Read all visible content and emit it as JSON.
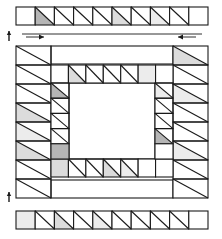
{
  "figure": {
    "background_color": "#ffffff",
    "line_color": "#1a1a1a",
    "cell_fill_plain": "#ffffff",
    "shade_dark": "#b5b5b5",
    "shade_light": "#dcdcdc",
    "shade_pale": "#ececec",
    "unit_size": 19.2,
    "stroke_width": 1.1
  },
  "strips": {
    "top_strip": {
      "label": "top-border-strip",
      "x": 16,
      "y": 7,
      "cells": 10,
      "cell_width": 19.2,
      "cell_height": 18,
      "units": [
        {
          "index": 0,
          "diagonal": "none",
          "fill": "#ffffff"
        },
        {
          "index": 1,
          "diagonal": "tl-br",
          "fill": "#b5b5b5"
        },
        {
          "index": 2,
          "diagonal": "tl-br",
          "fill": "#ffffff"
        },
        {
          "index": 3,
          "diagonal": "tl-br",
          "fill": "#ffffff"
        },
        {
          "index": 4,
          "diagonal": "tl-br",
          "fill": "#ffffff"
        },
        {
          "index": 5,
          "diagonal": "tl-br",
          "fill": "#dcdcdc"
        },
        {
          "index": 6,
          "diagonal": "tl-br",
          "fill": "#ffffff"
        },
        {
          "index": 7,
          "diagonal": "tl-br",
          "fill": "#ececec"
        },
        {
          "index": 8,
          "diagonal": "tl-br",
          "fill": "#ffffff"
        },
        {
          "index": 9,
          "diagonal": "none",
          "fill": "#ffffff"
        }
      ]
    },
    "bottom_strip": {
      "label": "bottom-border-strip",
      "x": 16,
      "y": 211,
      "cells": 10,
      "cell_width": 19.2,
      "cell_height": 18,
      "units": [
        {
          "index": 0,
          "diagonal": "none",
          "fill": "#ececec"
        },
        {
          "index": 1,
          "diagonal": "tl-br",
          "fill": "#ffffff"
        },
        {
          "index": 2,
          "diagonal": "tl-br",
          "fill": "#dcdcdc"
        },
        {
          "index": 3,
          "diagonal": "tl-br",
          "fill": "#ffffff"
        },
        {
          "index": 4,
          "diagonal": "tl-br",
          "fill": "#ececec"
        },
        {
          "index": 5,
          "diagonal": "tl-br",
          "fill": "#ffffff"
        },
        {
          "index": 6,
          "diagonal": "tl-br",
          "fill": "#ffffff"
        },
        {
          "index": 7,
          "diagonal": "tl-br",
          "fill": "#ffffff"
        },
        {
          "index": 8,
          "diagonal": "tl-br",
          "fill": "#ffffff"
        },
        {
          "index": 9,
          "diagonal": "none",
          "fill": "#ffffff"
        }
      ]
    }
  },
  "main_block": {
    "label": "main-quilt-block",
    "x": 16,
    "y": 46,
    "width": 192,
    "height": 152,
    "outer_ring": {
      "label": "outer-border-ring",
      "left_column": {
        "cells": 8,
        "units": [
          {
            "index": 0,
            "diagonal": "tl-br",
            "fill": "#ffffff"
          },
          {
            "index": 1,
            "diagonal": "tl-br",
            "fill": "#ffffff"
          },
          {
            "index": 2,
            "diagonal": "tl-br",
            "fill": "#ffffff"
          },
          {
            "index": 3,
            "diagonal": "tl-br",
            "fill": "#dcdcdc"
          },
          {
            "index": 4,
            "diagonal": "tl-br",
            "fill": "#ececec"
          },
          {
            "index": 5,
            "diagonal": "tl-br",
            "fill": "#dcdcdc"
          },
          {
            "index": 6,
            "diagonal": "tl-br",
            "fill": "#ffffff"
          },
          {
            "index": 7,
            "diagonal": "tl-br",
            "fill": "#ffffff"
          }
        ]
      },
      "right_column": {
        "cells": 8,
        "units": [
          {
            "index": 0,
            "diagonal": "tl-br",
            "fill": "#dcdcdc"
          },
          {
            "index": 1,
            "diagonal": "tl-br",
            "fill": "#ffffff"
          },
          {
            "index": 2,
            "diagonal": "tl-br",
            "fill": "#ececec"
          },
          {
            "index": 3,
            "diagonal": "tl-br",
            "fill": "#ffffff"
          },
          {
            "index": 4,
            "diagonal": "tl-br",
            "fill": "#ffffff"
          },
          {
            "index": 5,
            "diagonal": "tl-br",
            "fill": "#ececec"
          },
          {
            "index": 6,
            "diagonal": "tl-br",
            "fill": "#ffffff"
          },
          {
            "index": 7,
            "diagonal": "tl-br",
            "fill": "#ffffff"
          }
        ]
      },
      "top_rail": {
        "label": "outer-top-rail",
        "fill": "#ffffff"
      },
      "bottom_rail": {
        "label": "outer-bottom-rail",
        "fill": "#ffffff"
      }
    },
    "inner_ring": {
      "label": "inner-border-ring",
      "x": 51,
      "y": 65,
      "width": 122,
      "height": 112,
      "top_row": {
        "cells": 7,
        "units": [
          {
            "index": 0,
            "diagonal": "none",
            "fill": "#ffffff"
          },
          {
            "index": 1,
            "diagonal": "tl-br",
            "fill": "#dcdcdc"
          },
          {
            "index": 2,
            "diagonal": "tl-br",
            "fill": "#ffffff"
          },
          {
            "index": 3,
            "diagonal": "tl-br",
            "fill": "#ffffff"
          },
          {
            "index": 4,
            "diagonal": "tl-br",
            "fill": "#ffffff"
          },
          {
            "index": 5,
            "diagonal": "none",
            "fill": "#ececec"
          },
          {
            "index": 6,
            "diagonal": "none",
            "fill": "#ffffff"
          }
        ]
      },
      "bottom_row": {
        "cells": 7,
        "units": [
          {
            "index": 0,
            "diagonal": "none",
            "fill": "#dcdcdc"
          },
          {
            "index": 1,
            "diagonal": "tl-br",
            "fill": "#ffffff"
          },
          {
            "index": 2,
            "diagonal": "tl-br",
            "fill": "#ffffff"
          },
          {
            "index": 3,
            "diagonal": "tl-br",
            "fill": "#dcdcdc"
          },
          {
            "index": 4,
            "diagonal": "tl-br",
            "fill": "#ececec"
          },
          {
            "index": 5,
            "diagonal": "none",
            "fill": "#ffffff"
          },
          {
            "index": 6,
            "diagonal": "none",
            "fill": "#ffffff"
          }
        ]
      },
      "left_column": {
        "cells": 5,
        "units": [
          {
            "index": 0,
            "diagonal": "tl-br",
            "fill": "#b5b5b5"
          },
          {
            "index": 1,
            "diagonal": "tl-br",
            "fill": "#ffffff"
          },
          {
            "index": 2,
            "diagonal": "tl-br",
            "fill": "#ffffff"
          },
          {
            "index": 3,
            "diagonal": "tl-br",
            "fill": "#ffffff"
          },
          {
            "index": 4,
            "diagonal": "none",
            "fill": "#b5b5b5"
          }
        ]
      },
      "right_column": {
        "cells": 5,
        "units": [
          {
            "index": 0,
            "diagonal": "tl-br",
            "fill": "#ececec"
          },
          {
            "index": 1,
            "diagonal": "tl-br",
            "fill": "#ffffff"
          },
          {
            "index": 2,
            "diagonal": "tl-br",
            "fill": "#ffffff"
          },
          {
            "index": 3,
            "diagonal": "tl-br",
            "fill": "#b5b5b5"
          },
          {
            "index": 4,
            "diagonal": "none",
            "fill": "#ffffff"
          }
        ]
      },
      "center": {
        "label": "center-open-square",
        "fill": "#ffffff"
      }
    }
  },
  "annotations": {
    "arrows": [
      {
        "name": "top-left-direction-arrow",
        "x1": 26,
        "y1": 37,
        "x2": 44,
        "y2": 37,
        "direction": "right"
      },
      {
        "name": "top-right-direction-arrow",
        "x1": 196,
        "y1": 37,
        "x2": 178,
        "y2": 37,
        "direction": "left"
      },
      {
        "name": "top-measure-line",
        "x1": 22,
        "y1": 34,
        "x2": 202,
        "y2": 34,
        "direction": "none"
      }
    ],
    "tick_marks": [
      {
        "name": "left-tick-upper",
        "x": 9,
        "y": 31,
        "length": 10
      },
      {
        "name": "left-tick-lower",
        "x": 9,
        "y": 192,
        "length": 10
      }
    ]
  }
}
